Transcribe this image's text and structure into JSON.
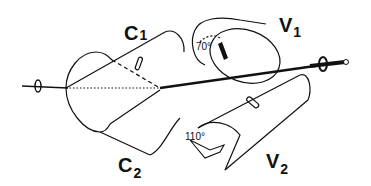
{
  "diagram": {
    "labels": {
      "c1": "C",
      "c1_sub": "1",
      "c2": "C",
      "c2_sub": "2",
      "v1": "V",
      "v1_sub": "1",
      "v2": "V",
      "v2_sub": "2"
    },
    "angles": {
      "upper": "70°",
      "lower": "110°"
    },
    "colors": {
      "ink": "#111111",
      "background": "#ffffff"
    }
  }
}
